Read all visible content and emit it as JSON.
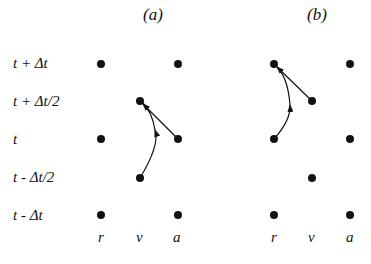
{
  "panels": [
    {
      "title": "(a)"
    },
    {
      "title": "(b)"
    }
  ],
  "row_labels": [
    "t + Δt",
    "t + Δt/2",
    "t",
    "t - Δt/2",
    "t - Δt"
  ],
  "column_labels": [
    "r",
    "v",
    "a"
  ]
}
